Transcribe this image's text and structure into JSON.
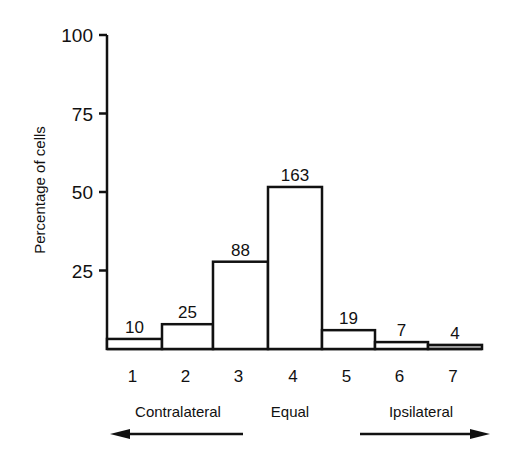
{
  "chart_data": {
    "type": "bar",
    "title": "",
    "xlabel": "",
    "ylabel": "Percentage of cells",
    "ylim": [
      0,
      100
    ],
    "yticks": [
      25,
      50,
      75,
      100
    ],
    "categories": [
      "1",
      "2",
      "3",
      "4",
      "5",
      "6",
      "7"
    ],
    "values": [
      3.2,
      7.9,
      27.8,
      51.6,
      6.0,
      2.2,
      1.3
    ],
    "bar_labels": [
      "10",
      "25",
      "88",
      "163",
      "19",
      "7",
      "4"
    ],
    "grid": false,
    "direction_labels": [
      {
        "text": "Contralateral",
        "arrow": "left"
      },
      {
        "text": "Equal",
        "arrow": "none"
      },
      {
        "text": "Ipsilateral",
        "arrow": "right"
      }
    ]
  }
}
